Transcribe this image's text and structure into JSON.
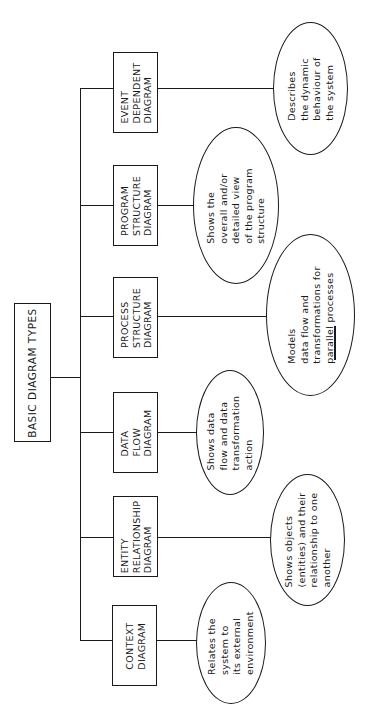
{
  "diagram": {
    "root": {
      "label": "BASIC DIAGRAM TYPES"
    },
    "types": [
      {
        "id": "context",
        "label": "CONTEXT\nDIAGRAM",
        "description": "Relates the\nsystem to\nits external\nenvironment"
      },
      {
        "id": "entity-relationship",
        "label": "ENTITY\nRELATIONSHIP\nDIAGRAM",
        "description": "Shows objects\n(entities) and their\nrelationship to one\nanother"
      },
      {
        "id": "data-flow",
        "label": "DATA\nFLOW\nDIAGRAM",
        "description": "Shows data\nflow and data\ntransformation\naction"
      },
      {
        "id": "process-structure",
        "label": "PROCESS\nSTRUCTURE\nDIAGRAM",
        "description_lines": [
          "Models",
          "data flow and",
          "transformations for"
        ],
        "description_last_underlined": "parallel",
        "description_last_rest": " processes"
      },
      {
        "id": "program-structure",
        "label": "PROGRAM\nSTRUCTURE\nDIAGRAM",
        "description": "Shows the\noverall and/or\ndetailed view\nof the program\nstructure"
      },
      {
        "id": "event-dependent",
        "label": "EVENT\nDEPENDENT\nDIAGRAM",
        "description": "Describes\nthe dynamic\nbehaviour of\nthe system"
      }
    ]
  }
}
